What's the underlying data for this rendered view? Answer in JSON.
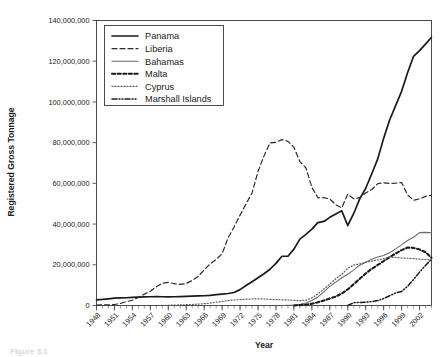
{
  "chart_data": {
    "type": "line",
    "title": "",
    "xlabel": "Year",
    "ylabel": "Registered Gross Tonnage",
    "xlim": [
      1948,
      2004
    ],
    "ylim": [
      0,
      140000000
    ],
    "grid": true,
    "legend_position": "top-left-inside",
    "y_ticks": [
      0,
      20000000,
      40000000,
      60000000,
      80000000,
      100000000,
      120000000,
      140000000
    ],
    "y_tick_labels": [
      "0",
      "20,000,000",
      "40,000,000",
      "60,000,000",
      "80,000,000",
      "100,000,000",
      "120,000,000",
      "140,000,000"
    ],
    "x_ticks": [
      1948,
      1951,
      1954,
      1957,
      1960,
      1963,
      1966,
      1969,
      1972,
      1975,
      1978,
      1981,
      1984,
      1987,
      1990,
      1993,
      1996,
      1999,
      2002
    ],
    "x_tick_labels": [
      "1948",
      "1951",
      "1954",
      "1957",
      "1960",
      "1963",
      "1966",
      "1969",
      "1972",
      "1975",
      "1978",
      "1981",
      "1984",
      "1987",
      "1990",
      "1993",
      "1996",
      "1999",
      "2002"
    ],
    "x": [
      1948,
      1949,
      1950,
      1951,
      1952,
      1953,
      1954,
      1955,
      1956,
      1957,
      1958,
      1959,
      1960,
      1961,
      1962,
      1963,
      1964,
      1965,
      1966,
      1967,
      1968,
      1969,
      1970,
      1971,
      1972,
      1973,
      1974,
      1975,
      1976,
      1977,
      1978,
      1979,
      1980,
      1981,
      1982,
      1983,
      1984,
      1985,
      1986,
      1987,
      1988,
      1989,
      1990,
      1991,
      1992,
      1993,
      1994,
      1995,
      1996,
      1997,
      1998,
      1999,
      2000,
      2001,
      2002,
      2003,
      2004
    ],
    "series": [
      {
        "name": "Panama",
        "style": "solid",
        "color": "#1a1a1a",
        "width": 1.7,
        "values": [
          2800000,
          3000000,
          3300000,
          3600000,
          3700000,
          3800000,
          4000000,
          4100000,
          4200000,
          4300000,
          4400000,
          4300000,
          4200000,
          4300000,
          4400000,
          4500000,
          4600000,
          4700000,
          4800000,
          5000000,
          5300000,
          5600000,
          5900000,
          6400000,
          7800000,
          9800000,
          11700000,
          13600000,
          15600000,
          17800000,
          20700000,
          24200000,
          24200000,
          27700000,
          32600000,
          34900000,
          37500000,
          40700000,
          41300000,
          43300000,
          45000000,
          46500000,
          39300000,
          45200000,
          52400000,
          57600000,
          64600000,
          71900000,
          82100000,
          91100000,
          98200000,
          105200000,
          114300000,
          122400000,
          125200000,
          128400000,
          131800000
        ]
      },
      {
        "name": "Liberia",
        "style": "dashed",
        "color": "#2a2a2a",
        "width": 1.2,
        "values": [
          200000,
          300000,
          300000,
          500000,
          1000000,
          1900000,
          2600000,
          4000000,
          5600000,
          7000000,
          9200000,
          10900000,
          11400000,
          10700000,
          10400000,
          10800000,
          12300000,
          14300000,
          17500000,
          20500000,
          22600000,
          25400000,
          33300000,
          38600000,
          44400000,
          49900000,
          55300000,
          65800000,
          73500000,
          79900000,
          80200000,
          81500000,
          80600000,
          77700000,
          70700000,
          67600000,
          58100000,
          52900000,
          53000000,
          52300000,
          49500000,
          48000000,
          54700000,
          52400000,
          53000000,
          55300000,
          57000000,
          59800000,
          60300000,
          60000000,
          60100000,
          60400000,
          54300000,
          51700000,
          52400000,
          53600000,
          54200000
        ]
      },
      {
        "name": "Bahamas",
        "style": "solid",
        "color": "#6a6a6a",
        "width": 1.1,
        "values": [
          0,
          0,
          0,
          0,
          0,
          0,
          0,
          0,
          0,
          0,
          0,
          0,
          0,
          0,
          0,
          0,
          0,
          0,
          0,
          0,
          0,
          0,
          0,
          0,
          0,
          0,
          0,
          0,
          0,
          0,
          0,
          0,
          100000,
          200000,
          500000,
          1200000,
          2500000,
          4200000,
          6700000,
          9400000,
          11500000,
          13600000,
          15300000,
          17500000,
          19800000,
          21300000,
          22700000,
          23800000,
          24600000,
          25900000,
          27800000,
          29800000,
          31900000,
          33500000,
          35800000,
          35900000,
          35700000
        ]
      },
      {
        "name": "Malta",
        "style": "dotted-dash",
        "color": "#1a1a1a",
        "width": 2.1,
        "values": [
          0,
          0,
          0,
          0,
          0,
          0,
          0,
          0,
          0,
          0,
          0,
          0,
          0,
          0,
          0,
          0,
          0,
          0,
          0,
          0,
          0,
          0,
          0,
          0,
          0,
          0,
          0,
          0,
          0,
          0,
          0,
          0,
          0,
          0,
          200000,
          400000,
          900000,
          1600000,
          2400000,
          3400000,
          4400000,
          5900000,
          7900000,
          10500000,
          13100000,
          15700000,
          18000000,
          19900000,
          21800000,
          23800000,
          25500000,
          27200000,
          28500000,
          28300000,
          27500000,
          26200000,
          23400000
        ]
      },
      {
        "name": "Cyprus",
        "style": "dotted",
        "color": "#5a5a5a",
        "width": 1.2,
        "values": [
          0,
          0,
          0,
          0,
          0,
          0,
          0,
          0,
          0,
          0,
          0,
          0,
          100000,
          200000,
          300000,
          400000,
          500000,
          700000,
          900000,
          1200000,
          1600000,
          2000000,
          2400000,
          2700000,
          2900000,
          3100000,
          3200000,
          3300000,
          3200000,
          3000000,
          2900000,
          2800000,
          2700000,
          2500000,
          2400000,
          2600000,
          3700000,
          5700000,
          8100000,
          10500000,
          13200000,
          15300000,
          18300000,
          19900000,
          20400000,
          21200000,
          21800000,
          22400000,
          23100000,
          23700000,
          23600000,
          23300000,
          23200000,
          23000000,
          22800000,
          22600000,
          22400000
        ]
      },
      {
        "name": "Marshall Islands",
        "style": "dash-dot-dot",
        "color": "#1a1a1a",
        "width": 1.5,
        "values": [
          0,
          0,
          0,
          0,
          0,
          0,
          0,
          0,
          0,
          0,
          0,
          0,
          0,
          0,
          0,
          0,
          0,
          0,
          0,
          0,
          0,
          0,
          0,
          0,
          0,
          0,
          0,
          0,
          0,
          0,
          0,
          0,
          0,
          0,
          0,
          0,
          0,
          0,
          0,
          0,
          0,
          0,
          0,
          1400000,
          1500000,
          1600000,
          1900000,
          2400000,
          3400000,
          4800000,
          6100000,
          6900000,
          9400000,
          12800000,
          16400000,
          19700000,
          22800000
        ]
      }
    ]
  },
  "legend": {
    "entries": [
      {
        "label": "Panama"
      },
      {
        "label": "Liberia"
      },
      {
        "label": "Bahamas"
      },
      {
        "label": "Malta"
      },
      {
        "label": "Cyprus"
      },
      {
        "label": "Marshall Islands"
      }
    ]
  },
  "caption": {
    "text": "Figure 3.1"
  }
}
